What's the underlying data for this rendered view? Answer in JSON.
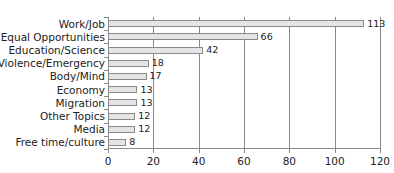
{
  "chart_data": {
    "type": "bar",
    "orientation": "horizontal",
    "title": "",
    "xlabel": "",
    "ylabel": "",
    "categories": [
      "Work/Job",
      "Equal Opportunities",
      "Education/Science",
      "Violence/Emergency",
      "Body/Mind",
      "Economy",
      "Migration",
      "Other Topics",
      "Media",
      "Free time/culture"
    ],
    "values": [
      113,
      66,
      42,
      18,
      17,
      13,
      13,
      12,
      12,
      8
    ],
    "value_labels": [
      "113",
      "66",
      "42",
      "18",
      "17",
      "13",
      "13",
      "12",
      "12",
      "8"
    ],
    "xlim": [
      0,
      120
    ],
    "x_ticks": [
      "0",
      "20",
      "40",
      "60",
      "80",
      "100",
      "120"
    ],
    "grid": "vertical",
    "legend": "none",
    "colors": {
      "bar_fill": "#e4e4e4",
      "bar_border": "#8a8a8a",
      "grid": "#8a8a8a"
    }
  }
}
